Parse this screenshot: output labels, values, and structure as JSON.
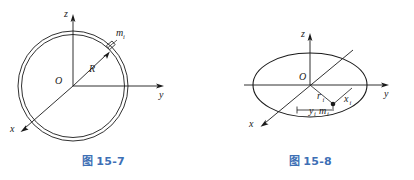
{
  "page": {
    "background_color": "#ffffff",
    "stroke_color": "#1a1a1a",
    "caption_color": "#3d6fb5"
  },
  "figures": [
    {
      "id": "fig-15-7",
      "caption_prefix": "图",
      "caption_number": "15-7",
      "description": "thin circular ring with axes z, y, x and mass element m_i at radius R",
      "shape": "double-circle-ring",
      "axes": [
        {
          "name": "z",
          "label": "z",
          "direction": "up"
        },
        {
          "name": "y",
          "label": "y",
          "direction": "right"
        },
        {
          "name": "x",
          "label": "x",
          "direction": "down-left"
        }
      ],
      "origin_label": "O",
      "labels": {
        "radius": "R",
        "mass_element": "m",
        "mass_element_subscript": "i"
      }
    },
    {
      "id": "fig-15-8",
      "caption_prefix": "图",
      "caption_number": "15-8",
      "description": "thin disc shown in perspective as an ellipse with axes z, y, x and mass element m_i at position r_i with coordinates x_i and y_i",
      "shape": "ellipse-disc",
      "axes": [
        {
          "name": "z",
          "label": "z",
          "direction": "up"
        },
        {
          "name": "y",
          "label": "y",
          "direction": "right"
        },
        {
          "name": "x",
          "label": "x",
          "direction": "down-left"
        }
      ],
      "origin_label": "O",
      "labels": {
        "radial_distance": "r",
        "radial_distance_subscript": "i",
        "x_coordinate": "x",
        "x_coordinate_subscript": "i",
        "y_coordinate": "y",
        "y_coordinate_subscript": "i",
        "mass_element": "m",
        "mass_element_subscript": "i"
      }
    }
  ]
}
